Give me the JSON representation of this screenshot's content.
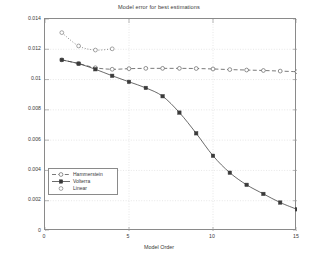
{
  "chart_data": {
    "type": "line",
    "title": "Model error for best estimations",
    "xlabel": "Model Order",
    "ylabel": "Error",
    "xlim": [
      0,
      15
    ],
    "ylim": [
      0,
      0.014
    ],
    "grid": true,
    "legend_position": "left-lower",
    "xticks": [
      0,
      5,
      10,
      15
    ],
    "xtick_labels": [
      "0",
      "5",
      "10",
      "15"
    ],
    "yticks": [
      0,
      0.002,
      0.004,
      0.006,
      0.008,
      0.01,
      0.012,
      0.014
    ],
    "ytick_labels": [
      "0",
      "0.002",
      "0.004",
      "0.006",
      "0.008",
      "0.01",
      "0.012",
      "0.014"
    ],
    "series": [
      {
        "name": "Hammerstein",
        "marker": "open-circle",
        "line_style": "dashed",
        "color": "#4d4d4d",
        "x": [
          1,
          2,
          3,
          4,
          5,
          6,
          7,
          8,
          9,
          10,
          11,
          12,
          13,
          14,
          15
        ],
        "values": [
          0.0113,
          0.01106,
          0.01078,
          0.01068,
          0.01072,
          0.01074,
          0.01074,
          0.01074,
          0.01073,
          0.0107,
          0.01066,
          0.01063,
          0.0106,
          0.01056,
          0.01052
        ]
      },
      {
        "name": "Volterra",
        "marker": "filled-square",
        "line_style": "solid",
        "color": "#3a3a3a",
        "x": [
          1,
          2,
          3,
          4,
          5,
          6,
          7,
          8,
          9,
          10,
          11,
          12,
          13,
          14,
          15
        ],
        "values": [
          0.0113,
          0.01105,
          0.01068,
          0.01025,
          0.00985,
          0.00945,
          0.0089,
          0.00782,
          0.00645,
          0.00497,
          0.00385,
          0.00305,
          0.00245,
          0.00188,
          0.00143
        ]
      },
      {
        "name": "Linear",
        "marker": "open-circle",
        "line_style": "dotted",
        "color": "#6a6a6a",
        "x": [
          1,
          2,
          3,
          4
        ],
        "values": [
          0.0131,
          0.01222,
          0.01195,
          0.01203
        ]
      }
    ]
  }
}
